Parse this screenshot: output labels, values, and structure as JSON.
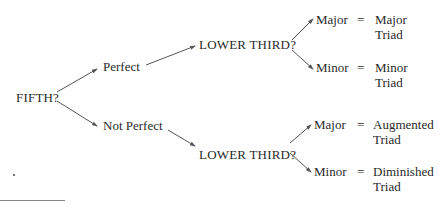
{
  "diagram": {
    "root": {
      "label": "FIFTH?"
    },
    "branches": [
      {
        "label": "Perfect",
        "question": "LOWER THIRD?",
        "outcomes": [
          {
            "third": "Major",
            "equals": "=",
            "result_line1": "Major",
            "result_line2": "Triad"
          },
          {
            "third": "Minor",
            "equals": "=",
            "result_line1": "Minor",
            "result_line2": "Triad"
          }
        ]
      },
      {
        "label": "Not Perfect",
        "question": "LOWER THIRD?",
        "outcomes": [
          {
            "third": "Major",
            "equals": "=",
            "result_line1": "Augmented",
            "result_line2": "Triad"
          },
          {
            "third": "Minor",
            "equals": "=",
            "result_line1": "Diminished",
            "result_line2": "Triad"
          }
        ]
      }
    ],
    "colors": {
      "text": "#2a2a2a",
      "arrow": "#555555",
      "rule": "#888888"
    }
  }
}
